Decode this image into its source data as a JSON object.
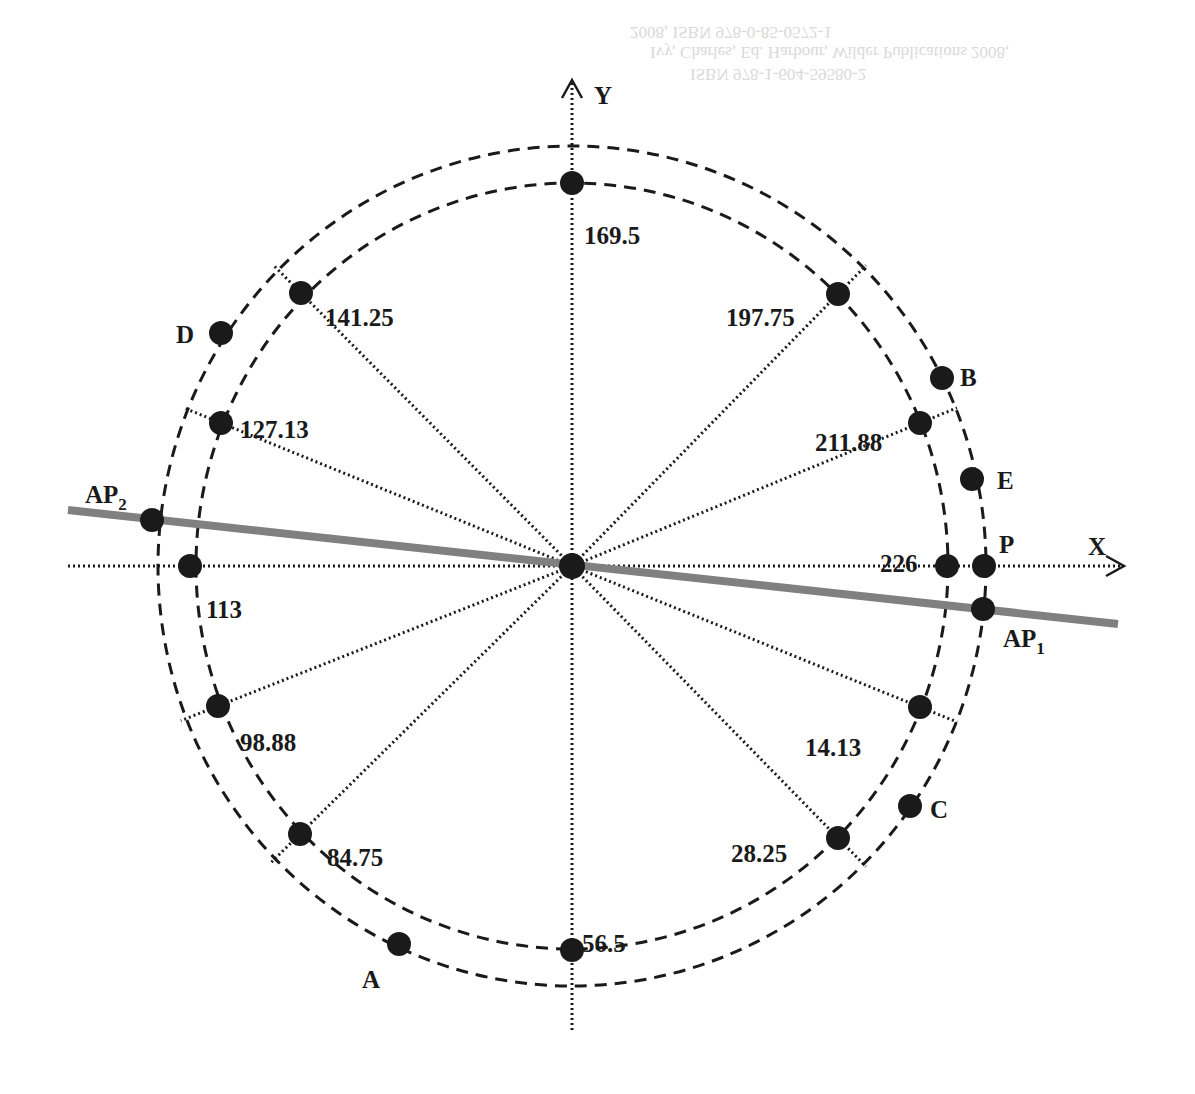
{
  "diagram": {
    "center": {
      "x": 572,
      "y": 566
    },
    "axes": {
      "x_label": "X",
      "y_label": "Y"
    },
    "colors": {
      "ink": "#1a1a1a",
      "fitted_line": "#808080",
      "background": "#ffffff"
    },
    "inner_circle": {
      "style": "dashed",
      "points": [
        {
          "label": "226",
          "x": 947,
          "y": 566,
          "lx": 880,
          "ly": 552
        },
        {
          "label": "211.88",
          "x": 920,
          "y": 423,
          "lx": 815,
          "ly": 431
        },
        {
          "label": "197.75",
          "x": 838,
          "y": 294,
          "lx": 726,
          "ly": 306
        },
        {
          "label": "169.5",
          "x": 572,
          "y": 183,
          "lx": 584,
          "ly": 224
        },
        {
          "label": "141.25",
          "x": 301,
          "y": 293,
          "lx": 325,
          "ly": 306
        },
        {
          "label": "127.13",
          "x": 221,
          "y": 423,
          "lx": 240,
          "ly": 418
        },
        {
          "label": "113",
          "x": 190,
          "y": 566,
          "lx": 206,
          "ly": 598
        },
        {
          "label": "98.88",
          "x": 218,
          "y": 706,
          "lx": 240,
          "ly": 731
        },
        {
          "label": "84.75",
          "x": 300,
          "y": 834,
          "lx": 327,
          "ly": 846
        },
        {
          "label": "56.5",
          "x": 572,
          "y": 950,
          "lx": 582,
          "ly": 932
        },
        {
          "label": "28.25",
          "x": 838,
          "y": 838,
          "lx": 731,
          "ly": 842
        },
        {
          "label": "14.13",
          "x": 920,
          "y": 707,
          "lx": 805,
          "ly": 736
        }
      ]
    },
    "outer_circle": {
      "style": "dashed",
      "points": [
        {
          "label": "B",
          "sub": "",
          "x": 942,
          "y": 378,
          "lx": 960,
          "ly": 386
        },
        {
          "label": "E",
          "sub": "",
          "x": 972,
          "y": 479,
          "lx": 997,
          "ly": 489
        },
        {
          "label": "P",
          "sub": "",
          "x": 984,
          "y": 566,
          "lx": 999,
          "ly": 553
        },
        {
          "label": "AP",
          "sub": "1",
          "x": 983,
          "y": 609,
          "lx": 1003,
          "ly": 647
        },
        {
          "label": "C",
          "sub": "",
          "x": 910,
          "y": 806,
          "lx": 930,
          "ly": 818
        },
        {
          "label": "A",
          "sub": "",
          "x": 399,
          "y": 944,
          "lx": 362,
          "ly": 988
        },
        {
          "label": "D",
          "sub": "",
          "x": 221,
          "y": 333,
          "lx": 176,
          "ly": 343
        },
        {
          "label": "AP",
          "sub": "2",
          "x": 152,
          "y": 520,
          "lx": 85,
          "ly": 503
        }
      ]
    },
    "fitted_line": {
      "x1": 68,
      "y1": 510,
      "x2": 1118,
      "y2": 624
    },
    "background_bleed_text": [
      "2008, ISBN 978-0-85-0572-1",
      "Ivy, Charles, Ed. Harbour, Wilder Publications 2008,",
      "ISBN 978-1-604-59580-2"
    ]
  }
}
